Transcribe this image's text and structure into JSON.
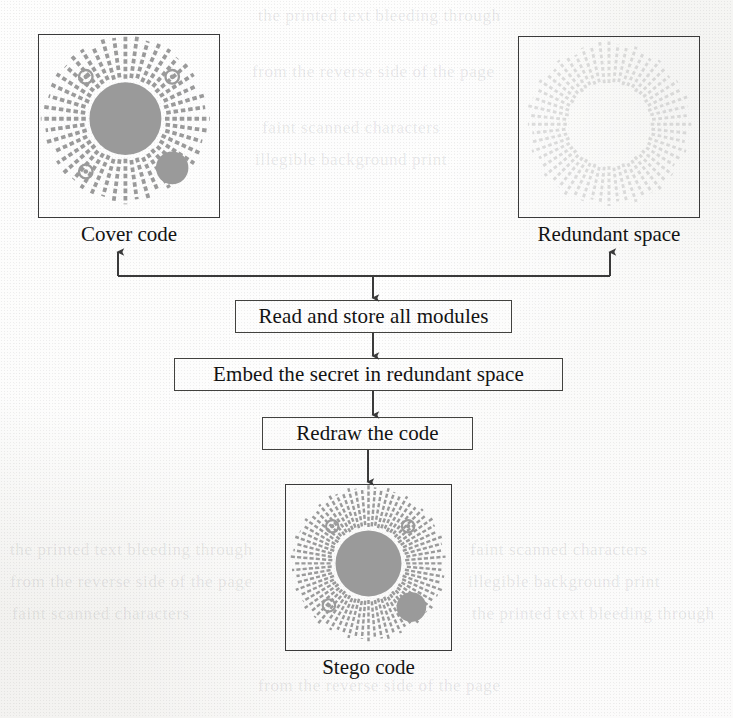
{
  "figure": {
    "type": "flowchart",
    "orientation": "top-down",
    "background_color": "#f2f2f0",
    "ink_color": "#1a1a1a",
    "module_fill_color": "#9a9a9a"
  },
  "panels": [
    {
      "id": "cover-code",
      "caption": "Cover code",
      "style": "dense-radial-code-with-center-disc",
      "has_center_disc": true,
      "has_small_disc": true,
      "ring_markers": 3,
      "spokes": 44,
      "ink_opacity": 1.0
    },
    {
      "id": "redundant-space",
      "caption": "Redundant space",
      "style": "sparse-radial-code-outline-only",
      "has_center_disc": false,
      "has_small_disc": false,
      "ring_markers": 0,
      "spokes": 56,
      "ink_opacity": 0.45
    },
    {
      "id": "stego-code",
      "caption": "Stego code",
      "style": "dense-radial-code-with-center-disc",
      "has_center_disc": true,
      "has_small_disc": true,
      "ring_markers": 3,
      "spokes": 72,
      "ink_opacity": 1.0
    }
  ],
  "steps": [
    {
      "id": "step-read",
      "label": "Read and store all modules"
    },
    {
      "id": "step-embed",
      "label": "Embed the secret in redundant space"
    },
    {
      "id": "step-redraw",
      "label": "Redraw the code"
    }
  ],
  "connectors": [
    {
      "id": "bus-to-cover",
      "from": "bus",
      "to": "cover-code",
      "direction": "up"
    },
    {
      "id": "bus-to-redundant",
      "from": "bus",
      "to": "redundant-space",
      "direction": "up"
    },
    {
      "id": "bus-to-read",
      "from": "bus",
      "to": "step-read",
      "direction": "down"
    },
    {
      "id": "read-to-embed",
      "from": "step-read",
      "to": "step-embed",
      "direction": "down"
    },
    {
      "id": "embed-to-redraw",
      "from": "step-embed",
      "to": "step-redraw",
      "direction": "down"
    },
    {
      "id": "redraw-to-stego",
      "from": "step-redraw",
      "to": "stego-code",
      "direction": "down"
    }
  ],
  "ghost_text": {
    "line_a": "the printed text bleeding through",
    "line_b": "from the reverse side of the page",
    "line_c": "faint scanned characters",
    "line_d": "illegible background print"
  }
}
